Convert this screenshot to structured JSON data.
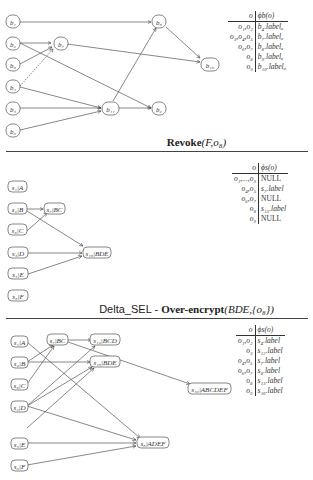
{
  "panel1": {
    "caption": {
      "bold": "Revoke",
      "args": "(F,o₈)"
    },
    "nodes": [
      {
        "id": "b1",
        "label": "b₁"
      },
      {
        "id": "b2",
        "label": "b₂"
      },
      {
        "id": "b3",
        "label": "b₃"
      },
      {
        "id": "b4",
        "label": "b₄"
      },
      {
        "id": "b5",
        "label": "b₅"
      },
      {
        "id": "b6",
        "label": "b₆"
      },
      {
        "id": "b7",
        "label": "b₇"
      },
      {
        "id": "b8",
        "label": "b₈"
      },
      {
        "id": "b9",
        "label": "b₉"
      },
      {
        "id": "b10",
        "label": "b₁₀"
      },
      {
        "id": "b11",
        "label": "b₁₁"
      }
    ],
    "table": {
      "header": [
        "o",
        "ϕb(o)"
      ],
      "rows": [
        [
          "o₁,o₂",
          "b₄.labelₐ"
        ],
        [
          "o₃,o₄,o₅",
          "b₇.labelₐ"
        ],
        [
          "o₆,o₇",
          "b₈.labelₐ"
        ],
        [
          "o₈",
          "b₉.labelₐ"
        ],
        [
          "o₉",
          "b₁₀.labelₐ"
        ]
      ]
    }
  },
  "panel2": {
    "caption": {
      "prefix": "Delta_SEL - ",
      "bold": "Over-encrypt",
      "args": "(BDE,{o₈})"
    },
    "nodes": [
      {
        "id": "s1",
        "label": "s₁|A"
      },
      {
        "id": "s2",
        "label": "s₂|B"
      },
      {
        "id": "s3",
        "label": "s₃|C"
      },
      {
        "id": "s4",
        "label": "s₄|D"
      },
      {
        "id": "s5",
        "label": "s₅|E"
      },
      {
        "id": "s6",
        "label": "s₆|F"
      },
      {
        "id": "s7",
        "label": "s₇|BC"
      },
      {
        "id": "s13",
        "label": "s₁₃|BDE"
      }
    ],
    "table": {
      "header": [
        "o",
        "ϕs(o)"
      ],
      "rows": [
        [
          "o₁,...,o₃",
          "NULL"
        ],
        [
          "o₄,o₅",
          "s₇.label"
        ],
        [
          "o₆,o₇",
          "NULL"
        ],
        [
          "o₈",
          "s₁₃.label"
        ],
        [
          "o₉",
          "NULL"
        ]
      ]
    }
  },
  "panel3": {
    "nodes": [
      {
        "id": "s1",
        "label": "s₁|A"
      },
      {
        "id": "s2",
        "label": "s₂|B"
      },
      {
        "id": "s3",
        "label": "s₃|C"
      },
      {
        "id": "s4",
        "label": "s₄|D"
      },
      {
        "id": "s5",
        "label": "s₅|E"
      },
      {
        "id": "s6",
        "label": "s₆|F"
      },
      {
        "id": "s7",
        "label": "s₇|BC"
      },
      {
        "id": "s12",
        "label": "s₁₂|BCD"
      },
      {
        "id": "s13",
        "label": "s₁₃|BDE"
      },
      {
        "id": "s10",
        "label": "s₁₀|ABCDEF"
      },
      {
        "id": "s8",
        "label": "s₈|ADEF"
      }
    ],
    "table": {
      "header": [
        "o",
        "ϕs(o)"
      ],
      "rows": [
        [
          "o₁,o₂",
          "s₄.label"
        ],
        [
          "o₃",
          "s₁₂.label"
        ],
        [
          "o₄,o₅",
          "s₇.label"
        ],
        [
          "o₆,o₇",
          "s₈.label"
        ],
        [
          "o₈",
          "s₁₃.label"
        ],
        [
          "o₉",
          "s₁₀.label"
        ]
      ]
    }
  }
}
